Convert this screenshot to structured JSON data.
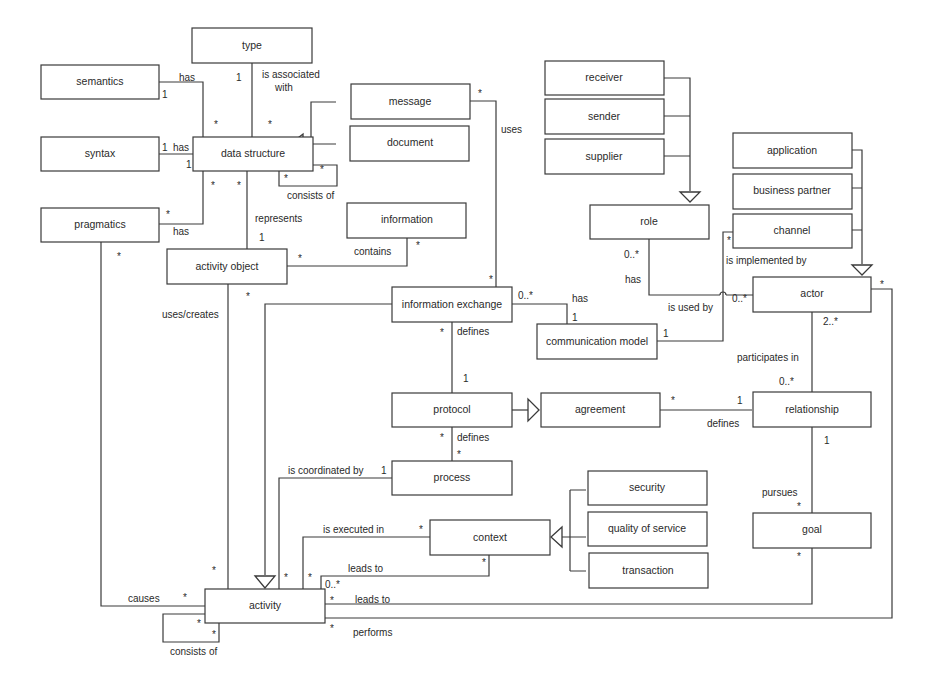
{
  "diagram": {
    "type": "UML class diagram",
    "classes": {
      "type": "type",
      "semantics": "semantics",
      "syntax": "syntax",
      "pragmatics": "pragmatics",
      "data_structure": "data structure",
      "message": "message",
      "document": "document",
      "information": "information",
      "activity_object": "activity object",
      "information_exchange": "information exchange",
      "communication_model": "communication model",
      "protocol": "protocol",
      "agreement": "agreement",
      "process": "process",
      "context": "context",
      "security": "security",
      "quality_of_service": "quality of service",
      "transaction": "transaction",
      "activity": "activity",
      "receiver": "receiver",
      "sender": "sender",
      "supplier": "supplier",
      "role": "role",
      "application": "application",
      "business_partner": "business partner",
      "channel": "channel",
      "actor": "actor",
      "relationship": "relationship",
      "goal": "goal"
    },
    "labels": {
      "has": "has",
      "is_associated_with_1": "is associated",
      "is_associated_with_2": "with",
      "consists_of": "consists of",
      "represents": "represents",
      "contains": "contains",
      "uses": "uses",
      "uses_creates": "uses/creates",
      "defines": "defines",
      "is_coordinated_by": "is coordinated by",
      "is_executed_in": "is executed in",
      "leads_to": "leads to",
      "causes": "causes",
      "performs": "performs",
      "is_used_by": "is used by",
      "is_implemented_by": "is implemented by",
      "participates_in": "participates in",
      "pursues": "pursues"
    },
    "multiplicity": {
      "one": "1",
      "many": "*",
      "zero_many": "0..*",
      "two_many": "2..*"
    },
    "associations": [
      {
        "from": "semantics",
        "to": "data structure",
        "label": "has",
        "from_mult": "1",
        "to_mult": "*"
      },
      {
        "from": "syntax",
        "to": "data structure",
        "label": "has",
        "from_mult": "1",
        "to_mult": "1"
      },
      {
        "from": "pragmatics",
        "to": "data structure",
        "label": "has",
        "from_mult": "*",
        "to_mult": "*"
      },
      {
        "from": "type",
        "to": "data structure",
        "label": "is associated with",
        "from_mult": "1",
        "to_mult": "*"
      },
      {
        "from": "data structure",
        "to": "data structure",
        "label": "consists of",
        "from_mult": "*",
        "to_mult": "*"
      },
      {
        "from": "data structure",
        "to": "activity object",
        "label": "represents",
        "from_mult": "*",
        "to_mult": "1"
      },
      {
        "from": "information",
        "to": "activity object",
        "label": "contains",
        "from_mult": "*",
        "to_mult": "*"
      },
      {
        "from": "message",
        "to": "information exchange",
        "label": "uses",
        "from_mult": "*",
        "to_mult": "*"
      },
      {
        "from": "activity object",
        "to": "activity",
        "label": "uses/creates",
        "from_mult": "*",
        "to_mult": "*"
      },
      {
        "from": "information exchange",
        "to": "communication model",
        "label": "has",
        "from_mult": "0..*",
        "to_mult": "1"
      },
      {
        "from": "information exchange",
        "to": "protocol",
        "label": "defines",
        "from_mult": "*",
        "to_mult": "1"
      },
      {
        "from": "protocol",
        "to": "process",
        "label": "defines",
        "from_mult": "*",
        "to_mult": "*"
      },
      {
        "from": "agreement",
        "to": "relationship",
        "label": "defines",
        "from_mult": "*",
        "to_mult": "1"
      },
      {
        "from": "process",
        "to": "activity",
        "label": "is coordinated by",
        "from_mult": "1",
        "to_mult": "*"
      },
      {
        "from": "context",
        "to": "activity",
        "label": "is executed in",
        "from_mult": "*",
        "to_mult": "*"
      },
      {
        "from": "context",
        "to": "activity",
        "label": "leads to",
        "from_mult": "*",
        "to_mult": "0..*"
      },
      {
        "from": "goal",
        "to": "activity",
        "label": "leads to",
        "from_mult": "*",
        "to_mult": "*"
      },
      {
        "from": "actor",
        "to": "activity",
        "label": "performs",
        "from_mult": "*",
        "to_mult": "*"
      },
      {
        "from": "pragmatics",
        "to": "activity",
        "label": "causes",
        "from_mult": "*",
        "to_mult": "*"
      },
      {
        "from": "activity",
        "to": "activity",
        "label": "consists of",
        "from_mult": "*",
        "to_mult": "*"
      },
      {
        "from": "role",
        "to": "actor",
        "label": "has / is used by",
        "from_mult": "0..*",
        "to_mult": "0..*"
      },
      {
        "from": "communication model",
        "to": "actor",
        "label": "is used by",
        "from_mult": "1",
        "to_mult": "0..*"
      },
      {
        "from": "channel",
        "to": "actor",
        "label": "is implemented by",
        "from_mult": "*",
        "to_mult": ""
      },
      {
        "from": "actor",
        "to": "relationship",
        "label": "participates in",
        "from_mult": "2..*",
        "to_mult": "0..*"
      },
      {
        "from": "relationship",
        "to": "goal",
        "label": "pursues",
        "from_mult": "1",
        "to_mult": "*"
      }
    ],
    "generalizations": [
      {
        "children": [
          "message",
          "document"
        ],
        "parent": "data structure"
      },
      {
        "children": [
          "receiver",
          "sender",
          "supplier"
        ],
        "parent": "role"
      },
      {
        "children": [
          "application",
          "business partner",
          "channel"
        ],
        "parent": "actor"
      },
      {
        "children": [
          "security",
          "quality of service",
          "transaction"
        ],
        "parent": "context"
      },
      {
        "children": [
          "protocol"
        ],
        "parent": "agreement"
      },
      {
        "children": [
          "information exchange"
        ],
        "parent": "activity"
      }
    ]
  }
}
